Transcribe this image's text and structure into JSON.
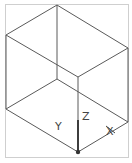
{
  "viewport": {
    "background": "#ffffff",
    "frame_color": "#cfcfcf",
    "edge_color": "#555555"
  },
  "axes": {
    "x_label": "X",
    "y_label": "Y",
    "z_label": "Z"
  },
  "box": {
    "vertices": {
      "top": [
        57,
        5
      ],
      "left_top": [
        6,
        35
      ],
      "right_top": [
        128,
        48
      ],
      "front_top": [
        78,
        77
      ],
      "back_bottom": [
        57,
        79
      ],
      "left_bottom": [
        6,
        109
      ],
      "right_bottom": [
        128,
        122
      ],
      "front_bottom": [
        78,
        152
      ]
    }
  }
}
